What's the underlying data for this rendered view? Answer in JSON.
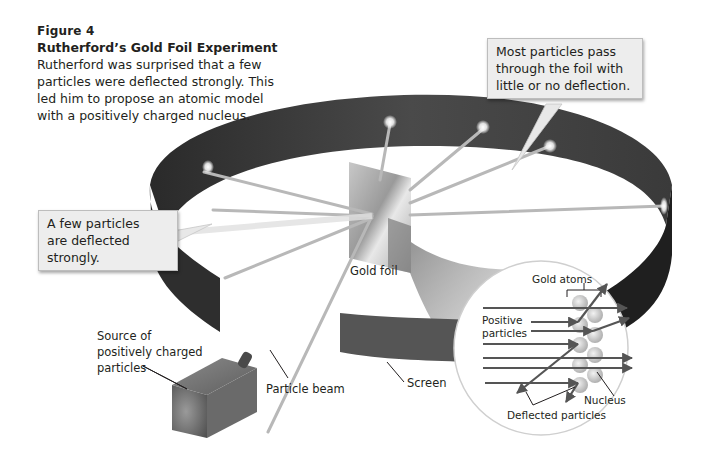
{
  "figure": {
    "number_label": "Figure 4",
    "title": "Rutherford’s Gold Foil Experiment",
    "caption_lines": [
      "Rutherford was surprised that a few",
      "particles were deflected strongly. This",
      "led him to propose an atomic model",
      "with a positively charged nucleus."
    ]
  },
  "callouts": {
    "most_particles": [
      "Most particles pass",
      "through the foil with",
      "little or no deflection."
    ],
    "few_particles": [
      "A few particles",
      "are deflected",
      "strongly."
    ]
  },
  "labels": {
    "gold_foil": "Gold foil",
    "source": [
      "Source of",
      "positively charged",
      "particles"
    ],
    "particle_beam": "Particle beam",
    "screen": "Screen"
  },
  "inset": {
    "gold_atoms": "Gold atoms",
    "positive_particles": [
      "Positive",
      "particles"
    ],
    "nucleus": "Nucleus",
    "deflected_particles": "Deflected particles"
  },
  "colors": {
    "screen_ring": "#3a3a3a",
    "foil": "#bdbdbd",
    "callout_bg": "#ededed",
    "arrow": "#555555"
  }
}
